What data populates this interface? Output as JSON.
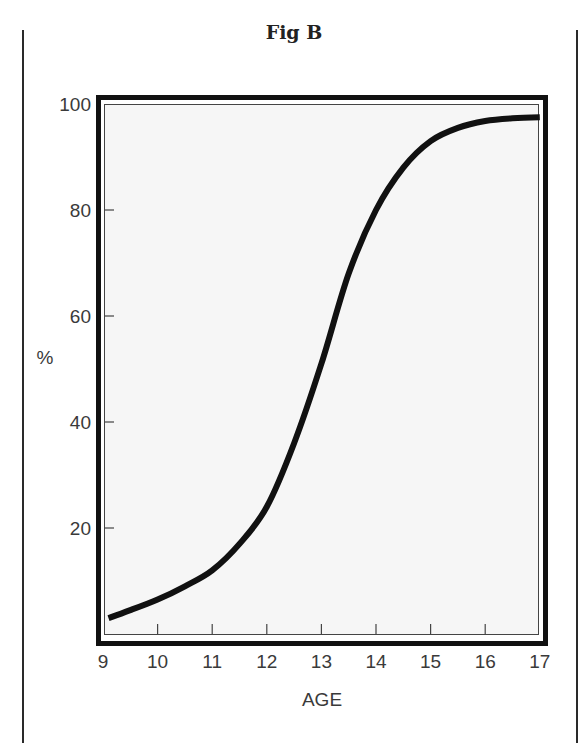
{
  "figure": {
    "title": "Fig B"
  },
  "chart_data": {
    "type": "line",
    "title": "Fig B",
    "xlabel": "AGE",
    "ylabel": "%",
    "x_ticks": [
      9,
      10,
      11,
      12,
      13,
      14,
      15,
      16,
      17
    ],
    "y_ticks": [
      20,
      40,
      60,
      80,
      100
    ],
    "xlim": [
      9,
      17
    ],
    "ylim": [
      0,
      100
    ],
    "grid": false,
    "legend": null,
    "series": [
      {
        "name": "cumulative %",
        "x": [
          9.1,
          9.5,
          10,
          10.5,
          11,
          11.5,
          12,
          12.5,
          13,
          13.5,
          14,
          14.5,
          15,
          15.5,
          16,
          16.5,
          17
        ],
        "values": [
          3,
          4.5,
          6.5,
          9,
          12,
          17,
          24,
          36,
          51,
          68,
          80,
          88,
          93,
          95.5,
          96.8,
          97.3,
          97.5
        ]
      }
    ]
  },
  "colors": {
    "line": "#111111",
    "frame": "#111111",
    "plot_background": "#f6f6f6",
    "text": "#3a3a3a"
  }
}
